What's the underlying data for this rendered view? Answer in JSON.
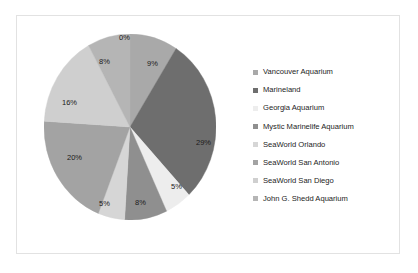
{
  "chart_data": {
    "type": "pie",
    "title": "",
    "legend_position": "right",
    "categories": [
      "Vancouver Aquarium",
      "Marineland",
      "Georgia Aquarium",
      "Mystic Marinelife Aquarium",
      "SeaWorld Orlando",
      "SeaWorld San Antonio",
      "SeaWorld San Diego",
      "John G. Shedd Aquarium"
    ],
    "values": [
      9,
      29,
      5,
      8,
      5,
      20,
      16,
      8
    ],
    "value_labels": [
      "9%",
      "29%",
      "5%",
      "8%",
      "5%",
      "20%",
      "16%",
      "8%"
    ],
    "extra_labels": [
      "0%"
    ],
    "colors": [
      "#a9a9a9",
      "#6e6e6e",
      "#ededed",
      "#8f8f8f",
      "#d6d6d6",
      "#a3a3a3",
      "#cfcfcf",
      "#b5b5b5"
    ],
    "slices": [
      {
        "label": "Vancouver Aquarium",
        "value": 9,
        "text": "9%",
        "color": "#a9a9a9"
      },
      {
        "label": "Marineland",
        "value": 29,
        "text": "29%",
        "color": "#6e6e6e"
      },
      {
        "label": "Georgia Aquarium",
        "value": 5,
        "text": "5%",
        "color": "#ededed"
      },
      {
        "label": "Mystic Marinelife Aquarium",
        "value": 8,
        "text": "8%",
        "color": "#8f8f8f"
      },
      {
        "label": "SeaWorld Orlando",
        "value": 5,
        "text": "5%",
        "color": "#d6d6d6"
      },
      {
        "label": "SeaWorld San Antonio",
        "value": 20,
        "text": "20%",
        "color": "#a3a3a3"
      },
      {
        "label": "SeaWorld San Diego",
        "value": 16,
        "text": "16%",
        "color": "#cfcfcf"
      },
      {
        "label": "John G. Shedd Aquarium",
        "value": 8,
        "text": "8%",
        "color": "#b5b5b5"
      }
    ]
  },
  "pie_labels": {
    "top_zero": "0%",
    "vancouver": "9%",
    "marineland": "29%",
    "georgia": "5%",
    "mystic": "8%",
    "orlando": "5%",
    "san_antonio": "20%",
    "san_diego": "16%",
    "shedd": "8%"
  },
  "legend": {
    "items": [
      {
        "label": "Vancouver Aquarium",
        "color": "#a9a9a9"
      },
      {
        "label": "Marineland",
        "color": "#6e6e6e"
      },
      {
        "label": "Georgia Aquarium",
        "color": "#ededed"
      },
      {
        "label": "Mystic Marinelife Aquarium",
        "color": "#8f8f8f"
      },
      {
        "label": "SeaWorld Orlando",
        "color": "#d6d6d6"
      },
      {
        "label": "SeaWorld San Antonio",
        "color": "#a3a3a3"
      },
      {
        "label": "SeaWorld San Diego",
        "color": "#cfcfcf"
      },
      {
        "label": "John G. Shedd Aquarium",
        "color": "#b5b5b5"
      }
    ]
  },
  "frame": {
    "border_color": "#e2e2e2",
    "background": "#ffffff"
  }
}
